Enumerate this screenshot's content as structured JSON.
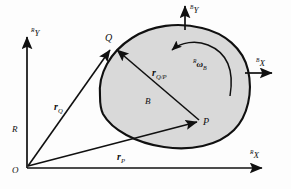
{
  "figure": {
    "type": "kinematics-diagram",
    "background": "#fdfdfd",
    "body_fill": "#d9d9d9",
    "stroke": "#101010"
  },
  "frames": {
    "reference": {
      "name": "R",
      "origin_label": "O",
      "x_axis": {
        "pre": "R",
        "main": "X"
      },
      "y_axis": {
        "pre": "R",
        "main": "Y"
      }
    },
    "body": {
      "name": "B",
      "x_axis": {
        "pre": "B",
        "main": "X"
      },
      "y_axis": {
        "pre": "B",
        "main": "Y"
      }
    }
  },
  "points": [
    {
      "id": "Q",
      "label": "Q",
      "x": 108,
      "y": 44
    },
    {
      "id": "P",
      "label": "P",
      "x": 200,
      "y": 122
    },
    {
      "id": "O",
      "label": "O",
      "x": 14,
      "y": 168
    }
  ],
  "body_label": "B",
  "vectors": [
    {
      "id": "rQ",
      "main": "r",
      "sub": "Q",
      "label": "r_Q"
    },
    {
      "id": "rP",
      "main": "r",
      "sub": "P",
      "label": "r_P"
    },
    {
      "id": "rQP",
      "main": "r",
      "sub": "Q/P",
      "label": "r_Q/P"
    }
  ],
  "angular_velocity": {
    "pre": "R",
    "symbol": "ω",
    "sub": "B",
    "label": "R omega B"
  },
  "axis_labels": {
    "ref_y": "Y",
    "ref_x": "X",
    "body_y": "Y",
    "body_x": "X",
    "ref_pre": "R",
    "body_pre": "B"
  }
}
